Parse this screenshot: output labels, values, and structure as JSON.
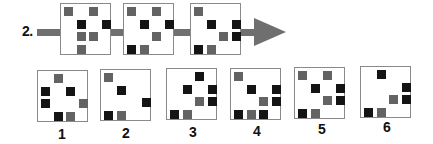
{
  "question": {
    "number_label": "2.",
    "colors": {
      "black": "#141414",
      "gray": "#636363",
      "arrow": "#6f6f6f",
      "border": "#8a8a8a"
    },
    "sequence": [
      {
        "squares": [
          {
            "col": 0,
            "row": 0,
            "color": "gray"
          },
          {
            "col": 2,
            "row": 0,
            "color": "gray"
          },
          {
            "col": 1,
            "row": 1,
            "color": "black"
          },
          {
            "col": 3,
            "row": 1,
            "color": "black"
          },
          {
            "col": 1,
            "row": 2,
            "color": "gray"
          },
          {
            "col": 2,
            "row": 2,
            "color": "gray"
          },
          {
            "col": 1,
            "row": 3,
            "color": "gray"
          }
        ]
      },
      {
        "squares": [
          {
            "col": 0,
            "row": 0,
            "color": "gray"
          },
          {
            "col": 2,
            "row": 0,
            "color": "gray"
          },
          {
            "col": 1,
            "row": 1,
            "color": "black"
          },
          {
            "col": 3,
            "row": 1,
            "color": "black"
          },
          {
            "col": 2,
            "row": 2,
            "color": "gray"
          },
          {
            "col": 0,
            "row": 3,
            "color": "black"
          },
          {
            "col": 1,
            "row": 3,
            "color": "gray"
          }
        ]
      },
      {
        "squares": [
          {
            "col": 0,
            "row": 0,
            "color": "gray"
          },
          {
            "col": 1,
            "row": 1,
            "color": "black"
          },
          {
            "col": 3,
            "row": 1,
            "color": "black"
          },
          {
            "col": 2,
            "row": 2,
            "color": "gray"
          },
          {
            "col": 3,
            "row": 2,
            "color": "black"
          },
          {
            "col": 0,
            "row": 3,
            "color": "black"
          },
          {
            "col": 1,
            "row": 3,
            "color": "gray"
          }
        ]
      }
    ],
    "options": [
      {
        "label": "1",
        "squares": [
          {
            "col": 1,
            "row": 0,
            "color": "gray"
          },
          {
            "col": 0,
            "row": 1,
            "color": "black"
          },
          {
            "col": 2,
            "row": 1,
            "color": "black"
          },
          {
            "col": 0,
            "row": 2,
            "color": "black"
          },
          {
            "col": 3,
            "row": 2,
            "color": "gray"
          },
          {
            "col": 1,
            "row": 3,
            "color": "black"
          },
          {
            "col": 2,
            "row": 3,
            "color": "gray"
          }
        ]
      },
      {
        "label": "2",
        "squares": [
          {
            "col": 0,
            "row": 0,
            "color": "gray"
          },
          {
            "col": 1,
            "row": 1,
            "color": "black"
          },
          {
            "col": 3,
            "row": 2,
            "color": "black"
          },
          {
            "col": 0,
            "row": 3,
            "color": "black"
          },
          {
            "col": 1,
            "row": 3,
            "color": "gray"
          }
        ]
      },
      {
        "label": "3",
        "squares": [
          {
            "col": 2,
            "row": 0,
            "color": "black"
          },
          {
            "col": 1,
            "row": 1,
            "color": "black"
          },
          {
            "col": 3,
            "row": 1,
            "color": "black"
          },
          {
            "col": 2,
            "row": 2,
            "color": "gray"
          },
          {
            "col": 3,
            "row": 2,
            "color": "black"
          },
          {
            "col": 0,
            "row": 3,
            "color": "black"
          },
          {
            "col": 1,
            "row": 3,
            "color": "gray"
          }
        ]
      },
      {
        "label": "4",
        "squares": [
          {
            "col": 0,
            "row": 0,
            "color": "gray"
          },
          {
            "col": 1,
            "row": 1,
            "color": "black"
          },
          {
            "col": 3,
            "row": 1,
            "color": "black"
          },
          {
            "col": 2,
            "row": 2,
            "color": "gray"
          },
          {
            "col": 3,
            "row": 2,
            "color": "black"
          },
          {
            "col": 0,
            "row": 3,
            "color": "black"
          },
          {
            "col": 1,
            "row": 3,
            "color": "gray"
          },
          {
            "col": 2,
            "row": 3,
            "color": "black"
          }
        ]
      },
      {
        "label": "5",
        "squares": [
          {
            "col": 0,
            "row": 0,
            "color": "gray"
          },
          {
            "col": 2,
            "row": 0,
            "color": "gray"
          },
          {
            "col": 1,
            "row": 1,
            "color": "black"
          },
          {
            "col": 3,
            "row": 1,
            "color": "black"
          },
          {
            "col": 2,
            "row": 2,
            "color": "gray"
          },
          {
            "col": 3,
            "row": 2,
            "color": "black"
          },
          {
            "col": 0,
            "row": 3,
            "color": "black"
          },
          {
            "col": 1,
            "row": 3,
            "color": "gray"
          }
        ]
      },
      {
        "label": "6",
        "squares": [
          {
            "col": 1,
            "row": 0,
            "color": "black"
          },
          {
            "col": 3,
            "row": 1,
            "color": "black"
          },
          {
            "col": 2,
            "row": 2,
            "color": "gray"
          },
          {
            "col": 3,
            "row": 2,
            "color": "black"
          },
          {
            "col": 0,
            "row": 3,
            "color": "black"
          },
          {
            "col": 1,
            "row": 3,
            "color": "gray"
          }
        ]
      }
    ]
  }
}
